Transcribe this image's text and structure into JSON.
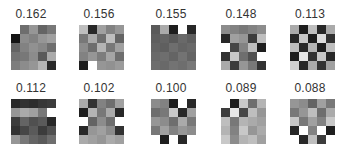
{
  "figure": {
    "grid_size": 5,
    "panels": [
      {
        "score": "0.162",
        "x": 6,
        "y": 8,
        "grid_x": 5,
        "grid_y": 17,
        "cells": [
          [
            255,
            110,
            150,
            100,
            120
          ],
          [
            20,
            140,
            130,
            150,
            160
          ],
          [
            100,
            130,
            145,
            135,
            110
          ],
          [
            115,
            120,
            140,
            90,
            170
          ],
          [
            125,
            140,
            150,
            180,
            40
          ]
        ]
      },
      {
        "score": "0.156",
        "x": 74,
        "y": 8,
        "grid_x": 5,
        "grid_y": 17,
        "cells": [
          [
            190,
            40,
            160,
            130,
            150
          ],
          [
            120,
            170,
            110,
            190,
            100
          ],
          [
            140,
            110,
            180,
            120,
            160
          ],
          [
            130,
            150,
            125,
            165,
            110
          ],
          [
            30,
            255,
            150,
            145,
            155
          ]
        ]
      },
      {
        "score": "0.155",
        "x": 146,
        "y": 8,
        "grid_x": 5,
        "grid_y": 17,
        "cells": [
          [
            90,
            170,
            30,
            255,
            40
          ],
          [
            95,
            100,
            90,
            105,
            95
          ],
          [
            100,
            95,
            110,
            100,
            105
          ],
          [
            105,
            110,
            100,
            115,
            100
          ],
          [
            110,
            105,
            115,
            110,
            120
          ]
        ]
      },
      {
        "score": "0.148",
        "x": 216,
        "y": 8,
        "grid_x": 5,
        "grid_y": 17,
        "cells": [
          [
            140,
            130,
            120,
            130,
            140
          ],
          [
            40,
            160,
            150,
            60,
            190
          ],
          [
            255,
            70,
            130,
            190,
            30
          ],
          [
            50,
            200,
            110,
            80,
            255
          ],
          [
            170,
            60,
            150,
            120,
            50
          ]
        ]
      },
      {
        "score": "0.113",
        "x": 285,
        "y": 8,
        "grid_x": 5,
        "grid_y": 17,
        "cells": [
          [
            170,
            30,
            190,
            40,
            170
          ],
          [
            40,
            200,
            30,
            220,
            50
          ],
          [
            190,
            40,
            180,
            30,
            190
          ],
          [
            30,
            230,
            50,
            200,
            40
          ],
          [
            210,
            40,
            170,
            50,
            160
          ]
        ]
      },
      {
        "score": "0.112",
        "x": 6,
        "y": 82,
        "grid_x": 5,
        "grid_y": 17,
        "cells": [
          [
            40,
            50,
            45,
            55,
            60
          ],
          [
            150,
            170,
            160,
            120,
            255
          ],
          [
            60,
            100,
            80,
            90,
            40
          ],
          [
            50,
            70,
            90,
            60,
            80
          ],
          [
            150,
            120,
            100,
            90,
            110
          ]
        ]
      },
      {
        "score": "0.102",
        "x": 74,
        "y": 82,
        "grid_x": 5,
        "grid_y": 17,
        "cells": [
          [
            170,
            50,
            130,
            110,
            160
          ],
          [
            30,
            180,
            120,
            170,
            40
          ],
          [
            255,
            100,
            140,
            110,
            255
          ],
          [
            40,
            150,
            160,
            140,
            50
          ],
          [
            170,
            160,
            150,
            170,
            160
          ]
        ]
      },
      {
        "score": "0.100",
        "x": 146,
        "y": 82,
        "grid_x": 5,
        "grid_y": 17,
        "cells": [
          [
            140,
            130,
            30,
            255,
            40
          ],
          [
            110,
            120,
            200,
            40,
            160
          ],
          [
            150,
            140,
            110,
            170,
            120
          ],
          [
            120,
            160,
            130,
            150,
            140
          ],
          [
            255,
            30,
            255,
            40,
            255
          ]
        ]
      },
      {
        "score": "0.089",
        "x": 216,
        "y": 82,
        "grid_x": 5,
        "grid_y": 17,
        "cells": [
          [
            255,
            30,
            200,
            110,
            180
          ],
          [
            60,
            230,
            70,
            190,
            150
          ],
          [
            190,
            120,
            180,
            170,
            160
          ],
          [
            180,
            130,
            200,
            150,
            170
          ],
          [
            200,
            140,
            180,
            190,
            160
          ]
        ]
      },
      {
        "score": "0.088",
        "x": 285,
        "y": 82,
        "grid_x": 5,
        "grid_y": 17,
        "cells": [
          [
            150,
            140,
            100,
            160,
            120
          ],
          [
            120,
            150,
            190,
            110,
            170
          ],
          [
            200,
            120,
            160,
            130,
            200
          ],
          [
            40,
            255,
            130,
            255,
            30
          ],
          [
            255,
            40,
            190,
            60,
            255
          ]
        ]
      }
    ]
  }
}
